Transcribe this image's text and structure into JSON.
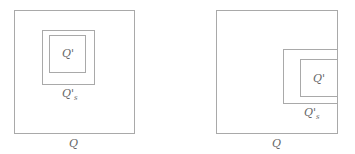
{
  "figures": [
    {
      "name": "left",
      "outer_label": "Q",
      "inner_label": "Q'",
      "mid_label_base": "Q'",
      "mid_label_sub": "s"
    },
    {
      "name": "right",
      "outer_label": "Q",
      "inner_label": "Q'",
      "mid_label_base": "Q'",
      "mid_label_sub": "s"
    }
  ],
  "colors": {
    "stroke": "#a9a9a9",
    "text": "#666666"
  }
}
